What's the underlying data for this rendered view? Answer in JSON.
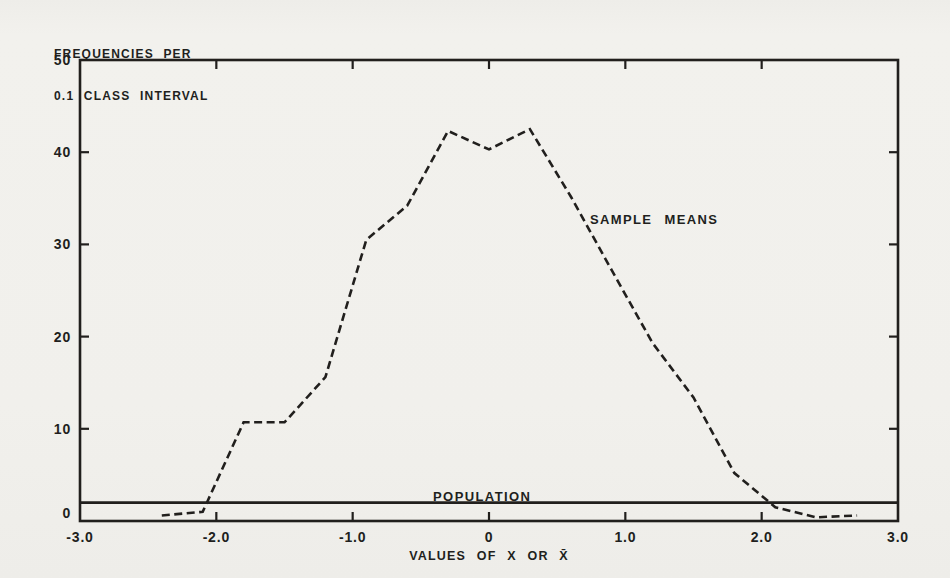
{
  "figure": {
    "paper_color": "#f1f0ec",
    "ink_color": "#211f1d"
  },
  "chart_data": {
    "type": "line",
    "title": "",
    "xlabel": "VALUES OF X OR X̄",
    "ylabel": "FREQUENCIES PER 0.1 CLASS INTERVAL",
    "ylabel_lines": [
      "FREQUENCIES PER",
      "0.1 CLASS INTERVAL"
    ],
    "xlim": [
      -3,
      3
    ],
    "ylim": [
      0,
      50
    ],
    "x_tick_values": [
      -3,
      -2,
      -1,
      0,
      1,
      2,
      3
    ],
    "x_tick_labels": [
      "-3.0",
      "-2.0",
      "-1.0",
      "0",
      "1.0",
      "2.0",
      "3.0"
    ],
    "y_tick_values": [
      0,
      10,
      20,
      30,
      40,
      50
    ],
    "y_tick_labels": [
      "0",
      "10",
      "20",
      "30",
      "40",
      "50"
    ],
    "grid": false,
    "legend_position": "inline-annotations",
    "series": [
      {
        "name": "SAMPLE MEANS",
        "line_style": "dashed",
        "points": [
          [
            -2.4,
            0.6
          ],
          [
            -2.1,
            1.0
          ],
          [
            -1.8,
            10.7
          ],
          [
            -1.5,
            10.7
          ],
          [
            -1.2,
            15.6
          ],
          [
            -0.9,
            30.5
          ],
          [
            -0.6,
            34.2
          ],
          [
            -0.3,
            42.3
          ],
          [
            0,
            40.3
          ],
          [
            0.3,
            42.5
          ],
          [
            0.6,
            35.2
          ],
          [
            0.9,
            27.2
          ],
          [
            1.2,
            19.3
          ],
          [
            1.5,
            13.4
          ],
          [
            1.8,
            5.2
          ],
          [
            2.1,
            1.5
          ],
          [
            2.4,
            0.4
          ],
          [
            2.7,
            0.6
          ]
        ]
      },
      {
        "name": "POPULATION",
        "line_style": "solid",
        "points": [
          [
            -3,
            2
          ],
          [
            3,
            2
          ]
        ]
      }
    ],
    "annotations": [
      {
        "text": "SAMPLE MEANS",
        "x": 0.74,
        "y": 32.6,
        "anchor": "start"
      },
      {
        "text": "POPULATION",
        "x": -0.05,
        "y": 2.6,
        "anchor": "middle"
      }
    ]
  }
}
